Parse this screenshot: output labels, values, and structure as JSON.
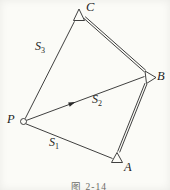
{
  "figure": {
    "caption": "图 2-14",
    "points": {
      "P": {
        "label": "P"
      },
      "A": {
        "label": "A"
      },
      "B": {
        "label": "B"
      },
      "C": {
        "label": "C"
      }
    },
    "vectors": {
      "s1": {
        "symbol": "S",
        "sub": "1"
      },
      "s2": {
        "symbol": "S",
        "sub": "2"
      },
      "s3": {
        "symbol": "S",
        "sub": "3"
      }
    },
    "colors": {
      "line": "#2a2a2a",
      "background": "#fbfbf7",
      "caption_text": "#6b6b66"
    }
  }
}
